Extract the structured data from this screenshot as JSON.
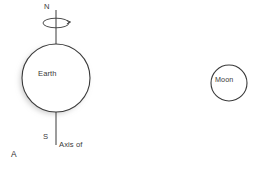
{
  "figure": {
    "label": "A",
    "background_color": "#ffffff",
    "stroke_color": "#3a3a3a",
    "text_color": "#3a3a3a",
    "shadow_color": "#e0e0e0"
  },
  "bodies": {
    "earth": {
      "label": "Earth",
      "center_x": 56,
      "center_y": 78,
      "radius": 34
    },
    "moon": {
      "label": "Moon",
      "center_x": 229,
      "center_y": 83,
      "radius": 18
    }
  },
  "axis": {
    "caption_line1": "Axis of",
    "caption_line2": "rotation",
    "caption": "Axis of rotation",
    "north_pole_label": "N",
    "south_pole_label": "S",
    "x": 56,
    "top_y": 10,
    "bottom_y": 145
  },
  "rotation_indicator": {
    "name": "rotation-arrow-ellipse",
    "center_x": 56,
    "center_y": 23,
    "rx": 13,
    "ry": 5
  }
}
